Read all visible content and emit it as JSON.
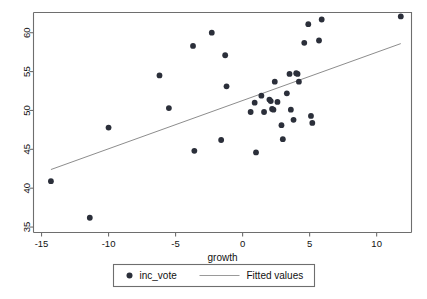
{
  "chart_data": {
    "type": "scatter",
    "title": "",
    "xlabel": "growth",
    "ylabel": "",
    "xlim": [
      -15.6,
      12.6
    ],
    "ylim": [
      34.3,
      62.6
    ],
    "xticks": [
      -15,
      -10,
      -5,
      0,
      5,
      10
    ],
    "xtick_labels": [
      "-15",
      "-10",
      "-5",
      "0",
      "5",
      "10"
    ],
    "yticks": [
      35,
      40,
      45,
      50,
      55,
      60
    ],
    "ytick_labels": [
      "35",
      "40",
      "45",
      "50",
      "55",
      "60"
    ],
    "grid": false,
    "legend_position": "below",
    "series": [
      {
        "name": "inc_vote",
        "type": "scatter",
        "marker": "filled-circle",
        "color": "#2b2f3a",
        "points": [
          {
            "x": -14.3,
            "y": 40.9
          },
          {
            "x": -11.4,
            "y": 36.2
          },
          {
            "x": -10.0,
            "y": 47.8
          },
          {
            "x": -6.2,
            "y": 54.5
          },
          {
            "x": -5.5,
            "y": 50.3
          },
          {
            "x": -3.7,
            "y": 58.3
          },
          {
            "x": -3.6,
            "y": 44.8
          },
          {
            "x": -2.3,
            "y": 60.0
          },
          {
            "x": -1.6,
            "y": 46.2
          },
          {
            "x": -1.3,
            "y": 57.1
          },
          {
            "x": -1.2,
            "y": 53.1
          },
          {
            "x": 0.6,
            "y": 49.8
          },
          {
            "x": 0.9,
            "y": 51.0
          },
          {
            "x": 1.0,
            "y": 44.6
          },
          {
            "x": 1.4,
            "y": 51.9
          },
          {
            "x": 1.6,
            "y": 49.8
          },
          {
            "x": 2.0,
            "y": 51.4
          },
          {
            "x": 2.1,
            "y": 51.2
          },
          {
            "x": 2.2,
            "y": 50.2
          },
          {
            "x": 2.3,
            "y": 50.1
          },
          {
            "x": 2.4,
            "y": 53.7
          },
          {
            "x": 2.6,
            "y": 51.1
          },
          {
            "x": 2.9,
            "y": 48.1
          },
          {
            "x": 3.0,
            "y": 46.3
          },
          {
            "x": 3.3,
            "y": 52.2
          },
          {
            "x": 3.5,
            "y": 54.7
          },
          {
            "x": 3.6,
            "y": 50.1
          },
          {
            "x": 3.8,
            "y": 48.8
          },
          {
            "x": 4.0,
            "y": 54.8
          },
          {
            "x": 4.1,
            "y": 54.7
          },
          {
            "x": 4.2,
            "y": 53.7
          },
          {
            "x": 4.6,
            "y": 58.7
          },
          {
            "x": 4.9,
            "y": 61.1
          },
          {
            "x": 5.1,
            "y": 49.3
          },
          {
            "x": 5.2,
            "y": 48.4
          },
          {
            "x": 5.7,
            "y": 59.0
          },
          {
            "x": 5.9,
            "y": 61.7
          },
          {
            "x": 11.8,
            "y": 62.1
          }
        ]
      },
      {
        "name": "Fitted values",
        "type": "line",
        "color": "#8d8d8d",
        "endpoints": [
          {
            "x": -14.3,
            "y": 42.4
          },
          {
            "x": 11.8,
            "y": 58.6
          }
        ]
      }
    ],
    "legend": [
      {
        "label": "inc_vote",
        "symbol": "filled-circle",
        "color": "#2b2f3a"
      },
      {
        "label": "Fitted values",
        "symbol": "line",
        "color": "#9a9a9a"
      }
    ]
  }
}
